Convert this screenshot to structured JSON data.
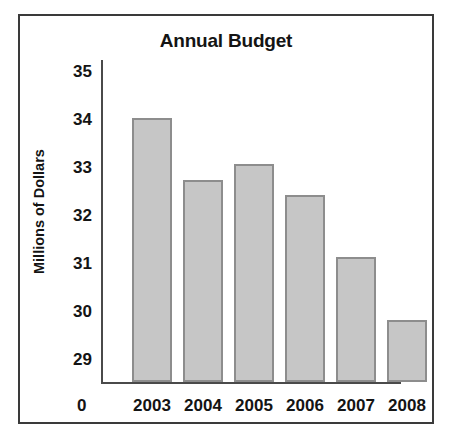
{
  "chart_data": {
    "type": "bar",
    "title": "Annual Budget",
    "xlabel": "",
    "ylabel": "Millions of Dollars",
    "categories": [
      "2003",
      "2004",
      "2005",
      "2006",
      "2007",
      "2008"
    ],
    "values": [
      34.05,
      32.75,
      33.1,
      32.45,
      31.15,
      29.85
    ],
    "ytick_labels": [
      "29",
      "30",
      "31",
      "32",
      "33",
      "34",
      "35"
    ],
    "yticks": [
      29,
      30,
      31,
      32,
      33,
      34,
      35
    ],
    "ylim": [
      28.55,
      35.3
    ],
    "axis_origin_label": "0",
    "grid": false,
    "legend": false,
    "bar_fill_color": "#c6c6c6",
    "bar_edge_color": "#8d8d8d",
    "axis_color": "#4a4a4a",
    "text_color": "#141414",
    "frame_color": "#3a3a3a",
    "background_color": "#ffffff"
  }
}
